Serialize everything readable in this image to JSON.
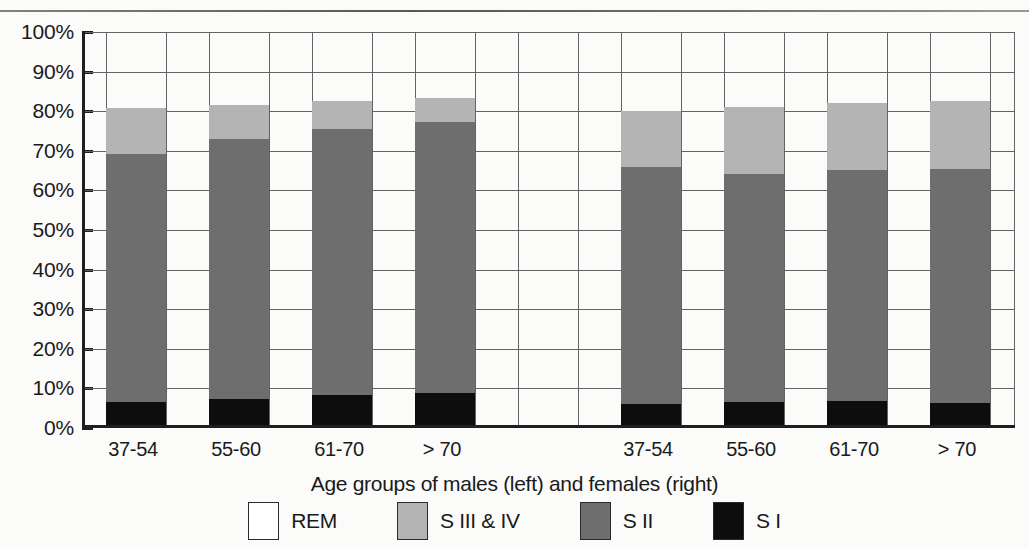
{
  "chart_data": {
    "type": "bar",
    "subtype": "stacked-percentage",
    "title": "",
    "xlabel": "Age groups of males (left) and females (right)",
    "ylabel": "",
    "ylim": [
      0,
      100
    ],
    "ytick_labels": [
      "100%",
      "90%",
      "80%",
      "70%",
      "60%",
      "50%",
      "40%",
      "30%",
      "20%",
      "10%",
      "0%"
    ],
    "ytick_values": [
      100,
      90,
      80,
      70,
      60,
      50,
      40,
      30,
      20,
      10,
      0
    ],
    "grid": true,
    "legend_position": "bottom",
    "categories": [
      "37-54",
      "55-60",
      "61-70",
      "> 70",
      "37-54",
      "55-60",
      "61-70",
      "> 70"
    ],
    "groups": [
      {
        "name": "males",
        "categories": [
          "37-54",
          "55-60",
          "61-70",
          "> 70"
        ]
      },
      {
        "name": "females",
        "categories": [
          "37-54",
          "55-60",
          "61-70",
          "> 70"
        ]
      }
    ],
    "series": [
      {
        "name": "S I",
        "color": "#0d0d0d",
        "values": [
          5.9,
          6.5,
          7.5,
          8.2,
          5.2,
          5.9,
          6.1,
          5.6
        ]
      },
      {
        "name": "S II",
        "color": "#6e6e6e",
        "values": [
          62.6,
          65.8,
          67.3,
          68.3,
          60.0,
          57.6,
          58.4,
          59.0
        ]
      },
      {
        "name": "S III & IV",
        "color": "#b4b4b4",
        "values": [
          11.5,
          8.4,
          7.0,
          6.1,
          14.1,
          16.8,
          16.9,
          17.2
        ]
      },
      {
        "name": "REM",
        "color": "#ffffff",
        "values": [
          20.0,
          19.3,
          18.2,
          17.4,
          20.7,
          19.7,
          18.6,
          18.2
        ]
      }
    ],
    "cumulative_tops": {
      "s1": [
        5.9,
        6.5,
        7.5,
        8.2,
        5.2,
        5.9,
        6.1,
        5.6
      ],
      "s2": [
        68.5,
        72.3,
        74.8,
        76.5,
        65.2,
        63.5,
        64.5,
        64.6
      ],
      "s34": [
        80.0,
        80.7,
        81.8,
        82.6,
        79.3,
        80.3,
        81.4,
        81.8
      ],
      "rem": [
        100,
        100,
        100,
        100,
        100,
        100,
        100,
        100
      ]
    }
  },
  "legend": {
    "items": [
      {
        "label": "REM",
        "swatch": "rem-swatch",
        "class": "sw-rem"
      },
      {
        "label": "S III & IV",
        "swatch": "s34-swatch",
        "class": "sw-s34"
      },
      {
        "label": "S II",
        "swatch": "s2-swatch",
        "class": "sw-s2"
      },
      {
        "label": "S I",
        "swatch": "s1-swatch",
        "class": "sw-s1"
      }
    ]
  },
  "colors": {
    "s1": "#0d0d0d",
    "s2": "#6e6e6e",
    "s34": "#b4b4b4",
    "rem": "#ffffff",
    "axis": "#1f1f1f",
    "grid": "#636363",
    "background": "#fbfbfa"
  }
}
